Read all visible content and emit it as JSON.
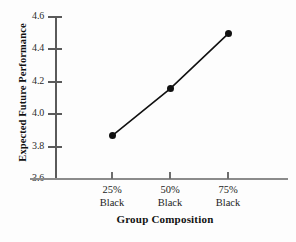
{
  "chart_data": {
    "type": "line",
    "title": "",
    "xlabel": "Group Composition",
    "ylabel": "Expected Future Performance",
    "categories": [
      "25% Black",
      "50% Black",
      "75% Black"
    ],
    "category_lines": [
      {
        "line1": "25%",
        "line2": "Black"
      },
      {
        "line1": "50%",
        "line2": "Black"
      },
      {
        "line1": "75%",
        "line2": "Black"
      }
    ],
    "values": [
      3.86,
      4.15,
      4.49
    ],
    "ylim": [
      3.6,
      4.6
    ],
    "yticks": [
      "3.6",
      "3.8",
      "4.0",
      "4.2",
      "4.4",
      "4.6"
    ],
    "ytick_values": [
      3.6,
      3.8,
      4.0,
      4.2,
      4.4,
      4.6
    ],
    "grid": false,
    "legend": "none",
    "marker": "filled-circle",
    "line_color": "#111111",
    "marker_color": "#111111",
    "axis_color": "#5a5a5a",
    "background_color": "#fdfdfd"
  }
}
